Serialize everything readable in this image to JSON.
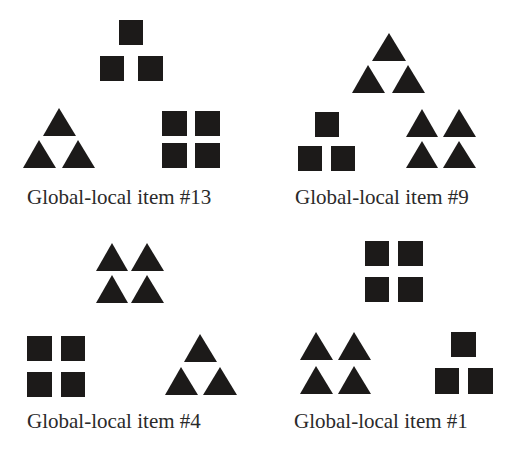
{
  "figure": {
    "fill_color": "#1c1a19",
    "background": "#ffffff",
    "items": [
      {
        "label": "Global-local item #13",
        "label_pos": [
          27,
          187
        ],
        "target": {
          "shape": "square",
          "arrangement": "triangle-of-3",
          "box": [
            100,
            20,
            163,
            81
          ]
        },
        "option_left": {
          "shape": "triangle",
          "arrangement": "triangle-of-3",
          "box": [
            23,
            108,
            95,
            168
          ]
        },
        "option_right": {
          "shape": "square",
          "arrangement": "grid-2x2",
          "box": [
            162,
            111,
            220,
            168
          ]
        }
      },
      {
        "label": "Global-local item #9",
        "label_pos": [
          295,
          187
        ],
        "target": {
          "shape": "triangle",
          "arrangement": "triangle-of-3",
          "box": [
            352,
            33,
            425,
            93
          ]
        },
        "option_left": {
          "shape": "square",
          "arrangement": "triangle-of-3",
          "box": [
            298,
            112,
            355,
            171
          ]
        },
        "option_right": {
          "shape": "triangle",
          "arrangement": "grid-2x2",
          "box": [
            406,
            109,
            476,
            168
          ]
        }
      },
      {
        "label": "Global-local item #4",
        "label_pos": [
          27,
          411
        ],
        "target": {
          "shape": "triangle",
          "arrangement": "grid-2x2",
          "box": [
            96,
            243,
            164,
            303
          ]
        },
        "option_left": {
          "shape": "square",
          "arrangement": "grid-2x2",
          "box": [
            27,
            336,
            85,
            397
          ]
        },
        "option_right": {
          "shape": "triangle",
          "arrangement": "triangle-of-3",
          "box": [
            165,
            334,
            237,
            395
          ]
        }
      },
      {
        "label": "Global-local item #1",
        "label_pos": [
          294,
          411
        ],
        "target": {
          "shape": "square",
          "arrangement": "grid-2x2",
          "box": [
            365,
            241,
            423,
            302
          ]
        },
        "option_left": {
          "shape": "triangle",
          "arrangement": "grid-2x2",
          "box": [
            300,
            332,
            371,
            394
          ]
        },
        "option_right": {
          "shape": "square",
          "arrangement": "triangle-of-3",
          "box": [
            435,
            332,
            493,
            394
          ]
        }
      }
    ]
  }
}
